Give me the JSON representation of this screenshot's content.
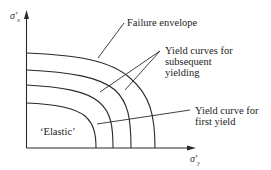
{
  "diagram": {
    "type": "yield-curves",
    "axes": {
      "y_label": "σ′",
      "y_sub": "x",
      "x_label": "σ′",
      "x_sub": "y"
    },
    "labels": {
      "failure_envelope": "Failure envelope",
      "subsequent_line1": "Yield curves for",
      "subsequent_line2": "subsequent",
      "subsequent_line3": "yielding",
      "first_line1": "Yield curve for",
      "first_line2": "first yield",
      "elastic": "‘Elastic’"
    },
    "curves": [
      {
        "name": "first-yield",
        "y_intercept_px": 103,
        "x_intercept_px": 96
      },
      {
        "name": "subsequent-1",
        "y_intercept_px": 85,
        "x_intercept_px": 113
      },
      {
        "name": "subsequent-2",
        "y_intercept_px": 70,
        "x_intercept_px": 131
      },
      {
        "name": "failure-envelope",
        "y_intercept_px": 53,
        "x_intercept_px": 155
      }
    ],
    "stroke_color": "#2a2a2a"
  }
}
